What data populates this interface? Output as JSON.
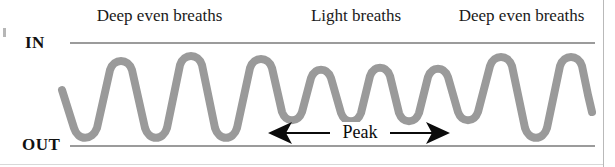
{
  "figure": {
    "width": 615,
    "height": 167,
    "background": "#ffffff",
    "border_color": "#b9b9b9"
  },
  "axis": {
    "in_label": "IN",
    "out_label": "OUT",
    "in_line_y": 43,
    "out_line_y": 146,
    "line_x_start": 70,
    "line_x_end": 595,
    "line_color": "#9b9b9b"
  },
  "phase_labels": [
    {
      "text": "Deep even breaths",
      "x": 78,
      "y": 6
    },
    {
      "text": "Light breaths",
      "x": 300,
      "y": 6
    },
    {
      "text": "Deep even breaths",
      "x": 440,
      "y": 6
    }
  ],
  "annotation": {
    "peak_label": "Peak",
    "arrow_color": "#0b0b0b",
    "arrow_y": 133,
    "arrow_x_start": 268,
    "arrow_x_end": 450
  },
  "waveform": {
    "color": "#9a9a9a",
    "stroke_width": 8,
    "deep_peak_y": 62,
    "deep_trough_y": 128,
    "light_peak_y": 74,
    "light_trough_y": 115,
    "path": "M 62 90 L 74 128 C 78 141 92 141 97 128 L 110 70 C 114 58 128 58 132 70 L 145 128 C 149 141 163 141 167 128 L 180 65 C 184 53 198 53 202 65 L 215 128 C 219 141 233 141 237 128 L 250 68 C 254 56 268 56 272 68 L 282 112 C 286 123 298 123 302 112 L 311 78 C 315 67 327 67 331 78 L 341 113 C 345 124 357 124 361 113 L 370 76 C 374 65 386 65 390 76 L 399 113 C 403 124 415 124 419 113 L 428 77 C 432 66 444 66 448 77 L 458 112 C 462 123 474 123 478 112 L 490 66 C 494 54 508 54 512 66 L 525 128 C 529 141 543 141 547 128 L 560 66 C 564 54 578 54 582 66 L 588 95 L 592 112"
  },
  "chart_data": {
    "type": "line",
    "xlabel": "",
    "ylabel": "Breath depth",
    "ytick_labels": [
      "IN",
      "OUT"
    ],
    "grid": false,
    "legend": "none",
    "annotations": [
      "Deep even breaths",
      "Light breaths",
      "Deep even breaths",
      "Peak"
    ],
    "series": [
      {
        "name": "Breath depth",
        "segments": [
          {
            "phase": "Deep even breaths",
            "cycles": 4,
            "amplitude": "large",
            "peak_level": "IN",
            "trough_level": "OUT"
          },
          {
            "phase": "Light breaths",
            "cycles": 5,
            "amplitude": "small",
            "peak_level": "mid-high",
            "trough_level": "mid-low"
          },
          {
            "phase": "Deep even breaths",
            "cycles": 2,
            "amplitude": "large",
            "peak_level": "IN",
            "trough_level": "OUT"
          }
        ]
      }
    ]
  }
}
